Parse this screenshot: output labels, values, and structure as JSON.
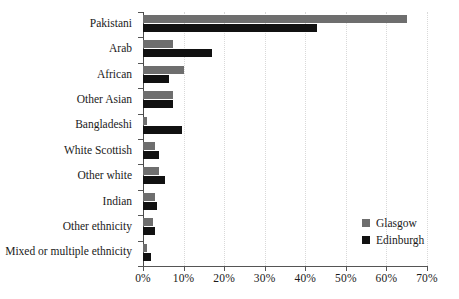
{
  "chart_data": {
    "type": "bar",
    "orientation": "horizontal",
    "title": "",
    "xlabel": "",
    "ylabel": "",
    "xlim": [
      0,
      70
    ],
    "xtick_labels": [
      "0%",
      "10%",
      "20%",
      "30%",
      "40%",
      "50%",
      "60%",
      "70%"
    ],
    "xtick_values": [
      0,
      10,
      20,
      30,
      40,
      50,
      60,
      70
    ],
    "grid": true,
    "grid_axis": "x",
    "legend_position": "lower-right",
    "categories": [
      "Pakistani",
      "Arab",
      "African",
      "Other Asian",
      "Bangladeshi",
      "White Scottish",
      "Other white",
      "Indian",
      "Other ethnicity",
      "Mixed or multiple ethnicity"
    ],
    "series": [
      {
        "name": "Glasgow",
        "color": "#6e6e6e",
        "values": [
          65,
          7.5,
          10,
          7.5,
          1,
          3,
          4,
          3,
          2.5,
          1
        ]
      },
      {
        "name": "Edinburgh",
        "color": "#111111",
        "values": [
          43,
          17,
          6.5,
          7.5,
          9.5,
          4,
          5.5,
          3.5,
          3,
          2
        ]
      }
    ]
  },
  "legend": {
    "items": [
      {
        "label": "Glasgow",
        "color": "#6e6e6e"
      },
      {
        "label": "Edinburgh",
        "color": "#111111"
      }
    ]
  }
}
